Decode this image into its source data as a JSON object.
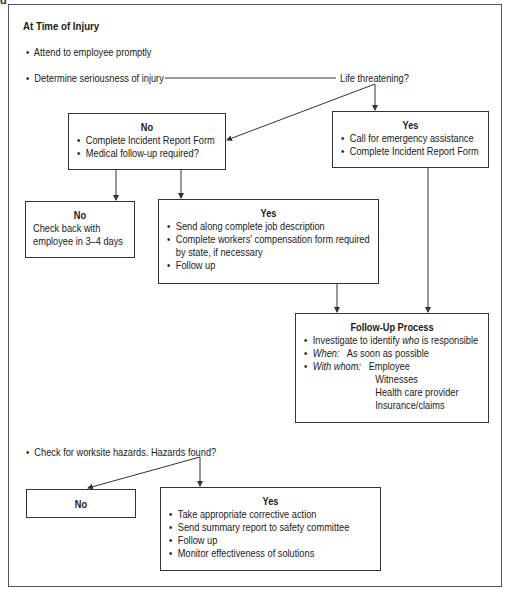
{
  "section1": {
    "heading": "At Time of Injury",
    "bullet1": "Attend to employee promptly",
    "bullet2": "Determine seriousness of injury",
    "decision": "Life threatening?"
  },
  "box_no_1": {
    "title": "No",
    "items": [
      "Complete Incident Report Form",
      "Medical follow-up required?"
    ]
  },
  "box_yes_1": {
    "title": "Yes",
    "items": [
      "Call for emergency assistance",
      "Complete Incident Report Form"
    ]
  },
  "box_no_2": {
    "title": "No",
    "lines": [
      "Check back with",
      "employee in 3–4 days"
    ]
  },
  "box_yes_2": {
    "title": "Yes",
    "items": [
      "Send along complete job description",
      "Complete workers' compensation form required",
      "by state, if necessary",
      "Follow up"
    ]
  },
  "followup": {
    "title": "Follow-Up Process",
    "item1_pre": "Investigate to identify ",
    "item1_em": "who",
    "item1_post": " is responsible",
    "when_label": "When:",
    "when_value": "As soon as possible",
    "whom_label": "With whom:",
    "whom_values": [
      "Employee",
      "Witnesses",
      "Health care provider",
      "Insurance/claims"
    ]
  },
  "section2": {
    "bullet": "Check for worksite hazards. Hazards found?"
  },
  "box_no_3": {
    "title": "No"
  },
  "box_yes_3": {
    "title": "Yes",
    "items": [
      "Take appropriate corrective action",
      "Send summary report to safety committee",
      "Follow up",
      "Monitor effectiveness of solutions"
    ]
  },
  "colors": {
    "line": "#333333",
    "border": "#555555",
    "text": "#1a1a1a"
  }
}
